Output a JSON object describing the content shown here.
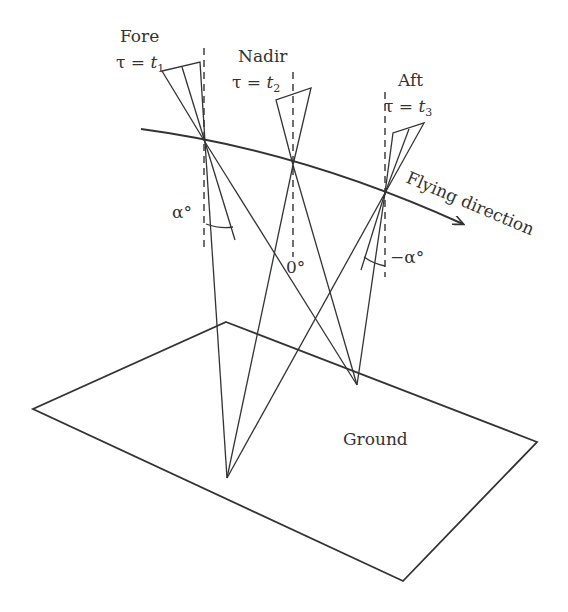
{
  "diagram": {
    "sensors": [
      {
        "name": "Fore",
        "tau": "τ = ",
        "t": "t",
        "sub": "1",
        "angle": "α°"
      },
      {
        "name": "Nadir",
        "tau": "τ = ",
        "t": "t",
        "sub": "2",
        "angle": "0°"
      },
      {
        "name": "Aft",
        "tau": "τ = ",
        "t": "t",
        "sub": "3",
        "angle": "−α°"
      }
    ],
    "flight_label": "Flying direction",
    "ground_label": "Ground",
    "colors": {
      "stroke": "#333333",
      "background": "#ffffff"
    }
  }
}
